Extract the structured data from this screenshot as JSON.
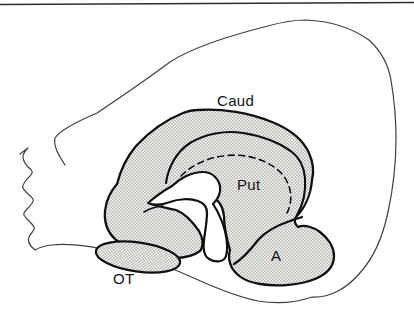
{
  "figure": {
    "kind": "anatomical line diagram",
    "labels": {
      "caudate": "Caud",
      "putamen": "Put",
      "amygdala": "A",
      "olfactory_tubercle": "OT"
    },
    "colors": {
      "background": "#ffffff",
      "top_rule": "#2f2f2f",
      "brain_outline": "#3f3f3f",
      "region_stroke": "#101010",
      "stipple_dot": "#6f6f6f",
      "stipple_background": "#f3f2ef",
      "label_text": "#141414"
    }
  }
}
